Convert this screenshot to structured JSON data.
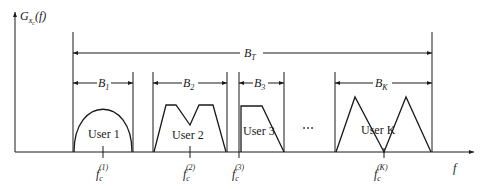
{
  "diagram": {
    "y_axis_label": {
      "main": "G",
      "sub": "x",
      "subsub": "c",
      "arg": "(f)"
    },
    "x_axis_label": "f",
    "total_bandwidth": {
      "main": "B",
      "sub": "T"
    },
    "ellipsis": "⋯",
    "users": [
      {
        "name": "User 1",
        "bandwidth": {
          "main": "B",
          "sub": "1"
        },
        "carrier": {
          "main": "f",
          "sub": "c",
          "sup": "(1)"
        },
        "shape": "semi-ellipse"
      },
      {
        "name": "User 2",
        "bandwidth": {
          "main": "B",
          "sub": "2"
        },
        "carrier": {
          "main": "f",
          "sub": "c",
          "sup": "(2)"
        },
        "shape": "double-trapezoid"
      },
      {
        "name": "User 3",
        "bandwidth": {
          "main": "B",
          "sub": "3"
        },
        "carrier": {
          "main": "f",
          "sub": "c",
          "sup": "(3)"
        },
        "shape": "right-trapezoid"
      },
      {
        "name": "User K",
        "bandwidth": {
          "main": "B",
          "sub": "K"
        },
        "carrier": {
          "main": "f",
          "sub": "c",
          "sup": "(K)"
        },
        "shape": "double-triangle"
      }
    ]
  }
}
